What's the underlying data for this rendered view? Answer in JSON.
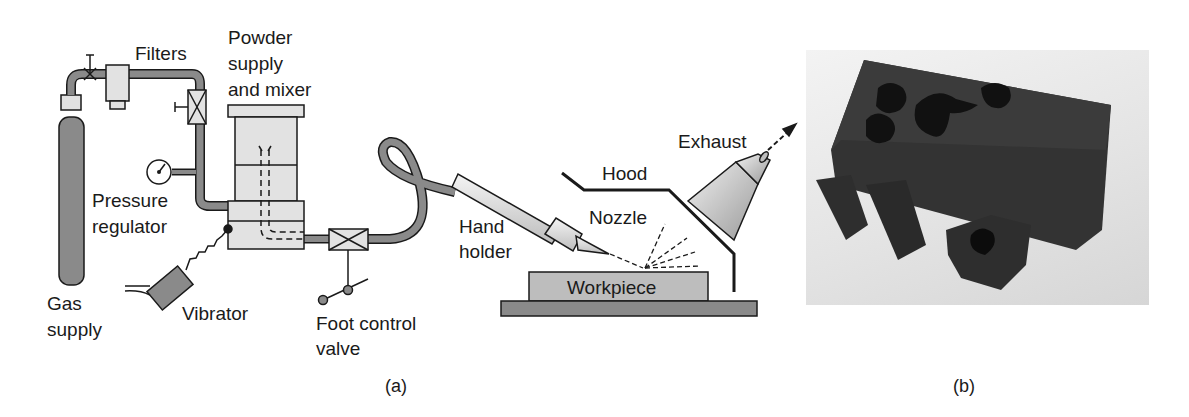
{
  "figure": {
    "panel_a": {
      "caption": "(a)",
      "labels": {
        "filters": "Filters",
        "powder_1": "Powder",
        "powder_2": "supply",
        "powder_3": "and mixer",
        "pressure_1": "Pressure",
        "pressure_2": "regulator",
        "gas_1": "Gas",
        "gas_2": "supply",
        "vibrator": "Vibrator",
        "foot_1": "Foot control",
        "foot_2": "valve",
        "hand_1": "Hand",
        "hand_2": "holder",
        "nozzle": "Nozzle",
        "hood": "Hood",
        "exhaust": "Exhaust",
        "workpiece": "Workpiece"
      }
    },
    "panel_b": {
      "caption": "(b)"
    }
  },
  "colors": {
    "pipe": "#8a8a8a",
    "light_fill": "#e2e2e2",
    "stroke": "#1a1a1a",
    "dark_part": "#2e2e2e"
  }
}
